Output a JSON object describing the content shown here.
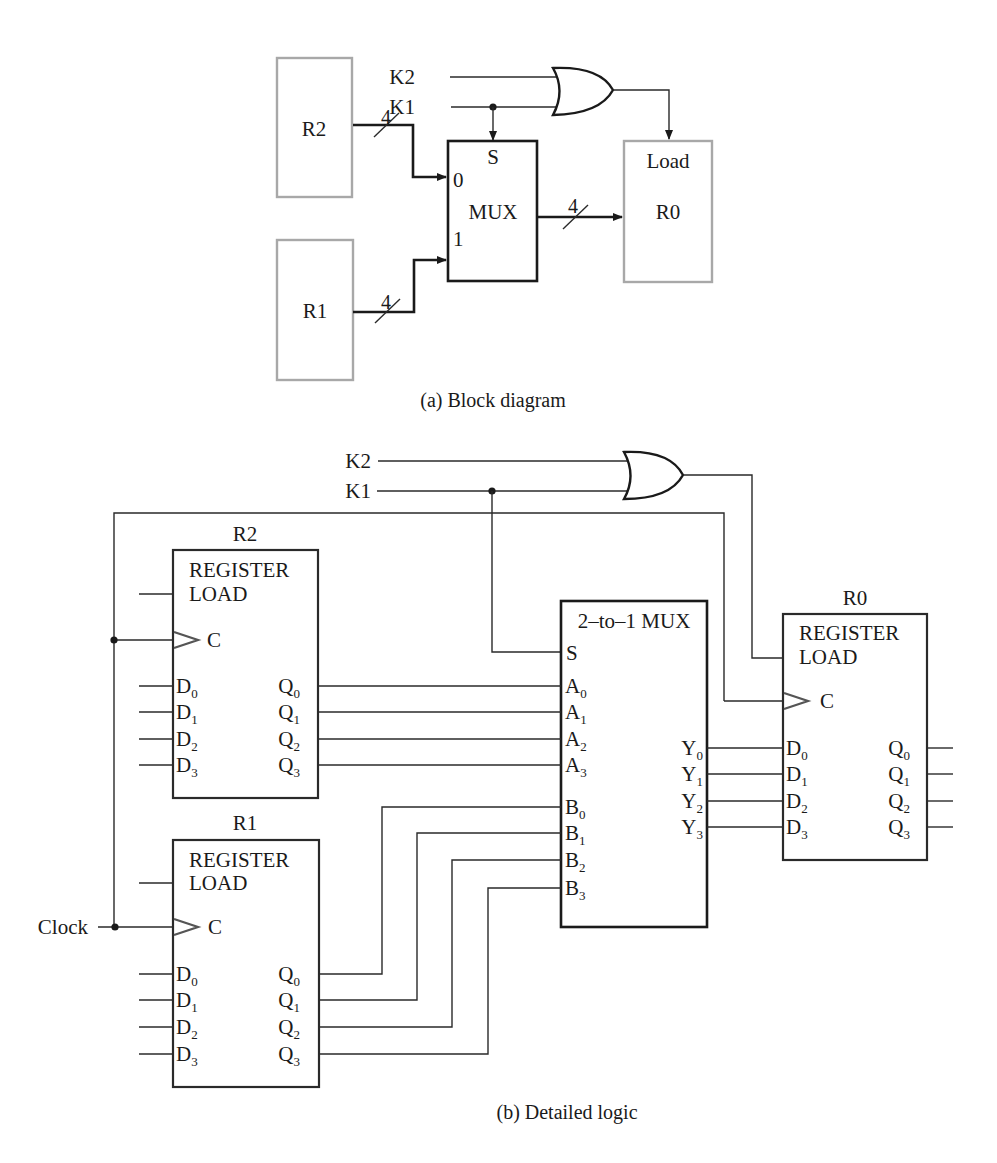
{
  "block_diagram": {
    "caption": "(a) Block diagram",
    "registers": [
      {
        "id": "R2",
        "label": "R2"
      },
      {
        "id": "R1",
        "label": "R1"
      },
      {
        "id": "R0",
        "label": "R0",
        "load_label": "Load"
      }
    ],
    "inputs": {
      "k2": "K2",
      "k1": "K1"
    },
    "mux": {
      "label": "MUX",
      "select": "S",
      "in0": "0",
      "in1": "1"
    },
    "bus_width": "4",
    "gate": "OR"
  },
  "detailed_logic": {
    "caption": "(b) Detailed logic",
    "inputs": {
      "k2": "K2",
      "k1": "K1",
      "clock": "Clock"
    },
    "register_title": "REGISTER",
    "load_label": "LOAD",
    "clock_pin": "C",
    "registers": [
      {
        "id": "R2",
        "label": "R2",
        "d": [
          "D",
          "D",
          "D",
          "D"
        ],
        "q": [
          "Q",
          "Q",
          "Q",
          "Q"
        ]
      },
      {
        "id": "R1",
        "label": "R1"
      },
      {
        "id": "R0",
        "label": "R0"
      }
    ],
    "d_pin": "D",
    "q_pin": "Q",
    "subscripts": [
      "0",
      "1",
      "2",
      "3"
    ],
    "mux": {
      "title": "2–to–1 MUX",
      "select": "S",
      "a_pin": "A",
      "b_pin": "B",
      "y_pin": "Y"
    },
    "gate": "OR"
  }
}
